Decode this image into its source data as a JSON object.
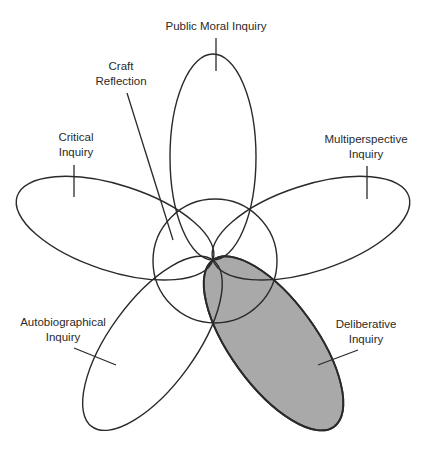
{
  "diagram": {
    "type": "five-petal overlapping ellipses with central circle",
    "center": {
      "x": 213,
      "y": 260
    },
    "circle_radius": 62,
    "colors": {
      "stroke": "#2a2a2a",
      "highlight_fill": "#a9a9a9",
      "background": "#ffffff"
    },
    "petals": [
      {
        "id": "public-moral",
        "label_lines": [
          "Public Moral Inquiry"
        ],
        "angle": 0,
        "highlighted": false
      },
      {
        "id": "multiperspective",
        "label_lines": [
          "Multiperspective",
          "Inquiry"
        ],
        "angle": 72,
        "highlighted": false
      },
      {
        "id": "deliberative",
        "label_lines": [
          "Deliberative",
          "Inquiry"
        ],
        "angle": 144,
        "highlighted": true
      },
      {
        "id": "autobiographical",
        "label_lines": [
          "Autobiographical",
          "Inquiry"
        ],
        "angle": 216,
        "highlighted": false
      },
      {
        "id": "critical",
        "label_lines": [
          "Critical",
          "Inquiry"
        ],
        "angle": 288,
        "highlighted": false
      }
    ],
    "center_label": {
      "id": "craft-reflection",
      "label_lines": [
        "Craft",
        "Reflection"
      ]
    }
  },
  "labels": {
    "public_moral": "Public Moral Inquiry",
    "craft_1": "Craft",
    "craft_2": "Reflection",
    "critical_1": "Critical",
    "critical_2": "Inquiry",
    "multi_1": "Multiperspective",
    "multi_2": "Inquiry",
    "auto_1": "Autobiographical",
    "auto_2": "Inquiry",
    "delib_1": "Deliberative",
    "delib_2": "Inquiry"
  }
}
